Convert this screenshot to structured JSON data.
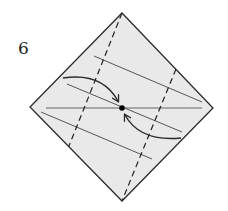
{
  "diagram": {
    "type": "origami-fold-step",
    "step_label": "6",
    "colors": {
      "paper_fill": "#e9e9e9",
      "outline": "#2b2b2b",
      "crease": "#555555",
      "dot": "#000000"
    },
    "paper": {
      "shape": "diamond",
      "vertices": {
        "top": [
          122,
          13
        ],
        "right": [
          213,
          108
        ],
        "bottom": [
          122,
          201
        ],
        "left": [
          30,
          107
        ]
      }
    },
    "valley_folds_dashed": [
      {
        "name": "left-dashed-fold",
        "from": [
          122,
          13
        ],
        "to": [
          69,
          146
        ]
      },
      {
        "name": "right-dashed-fold",
        "from": [
          176,
          69
        ],
        "to": [
          122,
          201
        ]
      }
    ],
    "crease_lines": [
      {
        "name": "horizontal-crease",
        "from": [
          46,
          108
        ],
        "to": [
          202,
          108
        ]
      },
      {
        "name": "upper-diagonal-crease",
        "from": [
          94,
          56
        ],
        "to": [
          202,
          102
        ]
      },
      {
        "name": "middle-diagonal-crease",
        "from": [
          67,
          84
        ],
        "to": [
          182,
          132
        ]
      },
      {
        "name": "lower-diagonal-crease",
        "from": [
          41,
          112
        ],
        "to": [
          152,
          159
        ]
      }
    ],
    "arrows": [
      {
        "name": "upper-fold-arrow",
        "from": [
          63,
          78
        ],
        "control": [
          102,
          72
        ],
        "to": [
          118,
          101
        ]
      },
      {
        "name": "lower-fold-arrow",
        "from": [
          181,
          138
        ],
        "control": [
          140,
          142
        ],
        "to": [
          125,
          115
        ]
      }
    ],
    "center_point": [
      122,
      108
    ]
  }
}
